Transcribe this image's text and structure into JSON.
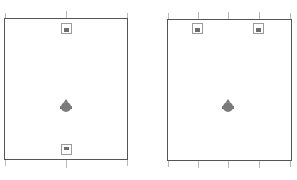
{
  "diagram": {
    "type": "speaker-layout",
    "colors": {
      "wall": "#555555",
      "tick": "#b8b8b8",
      "speaker_outline": "#9a9a9a",
      "speaker_fill": "#6e6e6e",
      "listener": "#7a7a7a"
    },
    "rooms": [
      {
        "id": "left-room",
        "speakers": [
          {
            "position": "front-center",
            "facing": "down"
          },
          {
            "position": "rear-center",
            "facing": "up"
          }
        ],
        "listener": {
          "position": "center-lower"
        },
        "ticks": 3
      },
      {
        "id": "right-room",
        "speakers": [
          {
            "position": "front-left",
            "facing": "down"
          },
          {
            "position": "front-right",
            "facing": "down"
          }
        ],
        "listener": {
          "position": "center-lower"
        },
        "ticks": 5
      }
    ]
  }
}
